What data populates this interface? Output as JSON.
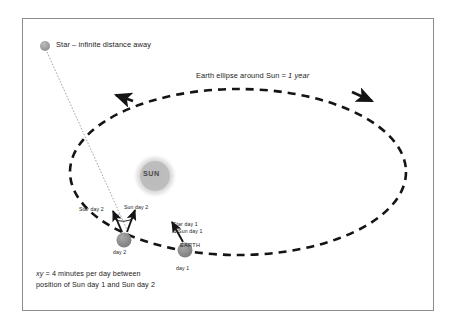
{
  "diagram": {
    "title_hidden": "Sidereal vs solar day diagram",
    "frame": {
      "border_color": "#8b8b8b",
      "background": "#ffffff"
    },
    "labels": {
      "star": "Star – infinite distance away",
      "ellipse_orbit": "Earth ellipse around Sun = ",
      "ellipse_orbit_italic": "1 year",
      "sun": "SUN",
      "star_day_2": "Star day 2",
      "sun_day_2": "Sun day 2",
      "xy_angle": "xy",
      "day_2": "day 2",
      "star_sun_day_1_line1": "Star day 1",
      "star_sun_day_1_line2": "& Sun day 1",
      "earth": "EARTH",
      "day_1": "day 1",
      "caption_italic": "xy",
      "caption_line1": " = 4 minutes per day between",
      "caption_line2": "position of Sun day 1 and Sun day 2"
    },
    "colors": {
      "orbit_dash": "#1a1a1a",
      "sun_body": "#b8b8b8",
      "sun_glow": "#d8d8d8",
      "earth_body": "#8f8f8f",
      "star_body": "#a6a6a6",
      "sight_line": "#8c8c8c",
      "text": "#1a1a1a",
      "frame_border": "#8b8b8b"
    },
    "geometry": {
      "orbit_center_x": 238,
      "orbit_center_y": 172,
      "orbit_rx": 168,
      "orbit_ry": 83,
      "sun_x": 155,
      "sun_y": 176,
      "sun_r": 16,
      "earth_day1_x": 185,
      "earth_day1_y": 250,
      "earth_day2_x": 124,
      "earth_day2_y": 240,
      "star_x": 45,
      "star_y": 46,
      "star_r": 5
    },
    "arrows": {
      "orbit_direction_left": "counterclockwise-arrowhead-top-left",
      "orbit_direction_right": "counterclockwise-arrowhead-top-right",
      "star_day2_vector": "arrow from Earth day 2 toward distant star",
      "sun_day2_vector": "arrow from Earth day 2 toward Sun",
      "day1_vector": "arrow from Earth day 1 toward Sun and star"
    }
  }
}
